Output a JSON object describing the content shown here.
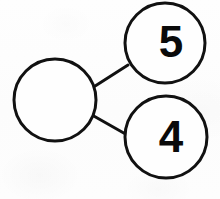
{
  "figure": {
    "background_color": "#fdfdfd",
    "stroke_color": "#111111",
    "text_color": "#0a0a0a"
  },
  "diagram_data": {
    "type": "number-bond",
    "whole": {
      "label": "",
      "filled": false,
      "center": [
        55,
        100
      ],
      "radius": 41
    },
    "parts": [
      {
        "label": "5",
        "filled": true,
        "center": [
          165,
          43
        ],
        "radius": 40
      },
      {
        "label": "4",
        "filled": true,
        "center": [
          166,
          137
        ],
        "radius": 41
      }
    ],
    "connectors": [
      {
        "from": [
          92,
          88
        ],
        "to": [
          128,
          65
        ]
      },
      {
        "from": [
          92,
          115
        ],
        "to": [
          129,
          136
        ]
      }
    ]
  }
}
